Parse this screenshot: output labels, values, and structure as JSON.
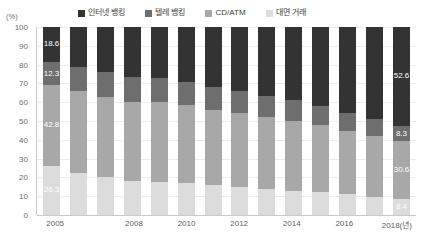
{
  "chart_data": {
    "type": "bar",
    "stacked": true,
    "stack_mode": "percent",
    "title": "",
    "subtitle": "",
    "xlabel": "2018(년)",
    "ylabel": "(%)",
    "ylim": [
      0,
      100
    ],
    "yticks": [
      0,
      10,
      20,
      30,
      40,
      50,
      60,
      70,
      80,
      90,
      100
    ],
    "grid": true,
    "legend_position": "top",
    "categories": [
      "2005",
      "2006",
      "2007",
      "2008",
      "2009",
      "2010",
      "2011",
      "2012",
      "2013",
      "2014",
      "2015",
      "2016",
      "2017",
      "2018"
    ],
    "visible_xtick_labels": [
      "2005",
      "2008",
      "2010",
      "2012",
      "2014",
      "2016",
      "2018(년)"
    ],
    "visible_xtick_categories": [
      "2005",
      "2008",
      "2010",
      "2012",
      "2014",
      "2016",
      "2018"
    ],
    "series": [
      {
        "name": "인터넷 뱅킹",
        "color": "#333333",
        "values": [
          18.6,
          21.5,
          24.0,
          26.5,
          27.0,
          29.0,
          32.0,
          34.0,
          36.5,
          39.0,
          42.0,
          45.5,
          49.0,
          52.6
        ]
      },
      {
        "name": "텔레 뱅킹",
        "color": "#6e6e6e",
        "values": [
          12.3,
          12.6,
          13.0,
          13.2,
          12.8,
          12.4,
          12.0,
          11.5,
          11.2,
          10.8,
          10.2,
          9.6,
          9.0,
          8.3
        ]
      },
      {
        "name": "CD/ATM",
        "color": "#a8a8a8",
        "values": [
          42.8,
          43.5,
          43.0,
          42.0,
          42.5,
          41.5,
          40.0,
          39.5,
          38.5,
          37.5,
          35.8,
          34.0,
          32.5,
          30.6
        ]
      },
      {
        "name": "대면 거래",
        "color": "#dcdcdc",
        "values": [
          26.3,
          22.4,
          20.0,
          18.3,
          17.7,
          17.1,
          16.0,
          15.0,
          13.8,
          12.7,
          12.0,
          10.9,
          9.5,
          8.4
        ]
      }
    ],
    "data_labels": {
      "2005": {
        "인터넷 뱅킹": "18.6",
        "텔레 뱅킹": "12.3",
        "CD/ATM": "42.8",
        "대면 거래": "26.3"
      },
      "2018": {
        "인터넷 뱅킹": "52.6",
        "텔레 뱅킹": "8.3",
        "CD/ATM": "30.6",
        "대면 거래": "8.4"
      }
    }
  }
}
